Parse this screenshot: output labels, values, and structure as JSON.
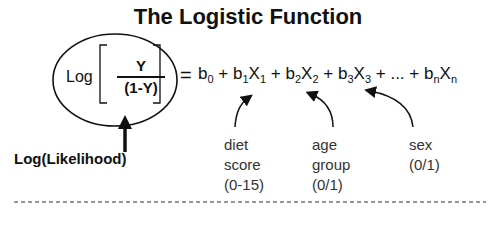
{
  "title": "The Logistic Function",
  "lhs": {
    "log_label": "Log",
    "numerator": "Y",
    "denominator": "(1-Y)",
    "equals": "="
  },
  "rhs": {
    "terms": [
      {
        "coef": "b",
        "coef_sub": "0",
        "var": "",
        "var_sub": ""
      },
      {
        "coef": "b",
        "coef_sub": "1",
        "var": "X",
        "var_sub": "1"
      },
      {
        "coef": "b",
        "coef_sub": "2",
        "var": "X",
        "var_sub": "2"
      },
      {
        "coef": "b",
        "coef_sub": "3",
        "var": "X",
        "var_sub": "3"
      },
      {
        "coef": "...",
        "coef_sub": "",
        "var": "",
        "var_sub": ""
      },
      {
        "coef": "b",
        "coef_sub": "n",
        "var": "X",
        "var_sub": "n"
      }
    ],
    "plus": "+"
  },
  "annotations": {
    "log_likelihood": "Log(Likelihood)",
    "diet": {
      "line1": "diet",
      "line2": "score",
      "line3": "(0-15)"
    },
    "age": {
      "line1": "age",
      "line2": "group",
      "line3": "(0/1)"
    },
    "sex": {
      "line1": "sex",
      "line2": "(0/1)"
    }
  },
  "colors": {
    "ink": "#111111",
    "background": "#ffffff"
  }
}
